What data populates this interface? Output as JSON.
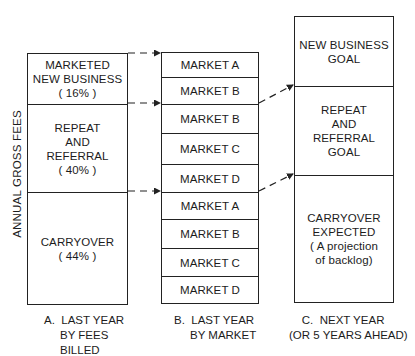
{
  "y_axis_label": "ANNUAL GROSS FEES",
  "columns": [
    {
      "id": "A",
      "caption": "A.  LAST YEAR\n     BY FEES\n     BILLED",
      "segments": [
        {
          "label": "MARKETED\nNEW BUSINESS\n( 16% )",
          "percent": 16
        },
        {
          "label": "REPEAT\nAND\nREFERRAL\n( 40% )",
          "percent": 40
        },
        {
          "label": "CARRYOVER\n( 44% )",
          "percent": 44
        }
      ]
    },
    {
      "id": "B",
      "caption": "B.  LAST YEAR\n     BY MARKET",
      "segments": [
        {
          "label": "MARKET A"
        },
        {
          "label": "MARKET B"
        },
        {
          "label": "MARKET B"
        },
        {
          "label": "MARKET C"
        },
        {
          "label": "MARKET D"
        },
        {
          "label": "MARKET A"
        },
        {
          "label": "MARKET B"
        },
        {
          "label": "MARKET C"
        },
        {
          "label": "MARKET D"
        }
      ]
    },
    {
      "id": "C",
      "caption": "    C.  NEXT YEAR\n(OR 5 YEARS AHEAD)",
      "segments": [
        {
          "label": "NEW BUSINESS\nGOAL"
        },
        {
          "label": "REPEAT\nAND\nREFERRAL\nGOAL"
        },
        {
          "label": "CARRYOVER\nEXPECTED\n( A projection\nof backlog)"
        }
      ]
    }
  ],
  "connectors": [
    {
      "from": "A.top",
      "to": "B.top",
      "style": "dashed-arrow"
    },
    {
      "from": "A.new_business_bottom",
      "to": "B.row2_bottom",
      "style": "dashed-arrow"
    },
    {
      "from": "A.repeat_bottom",
      "to": "B.row5_bottom",
      "style": "dashed-arrow"
    },
    {
      "from": "B.row2_bottom",
      "to": "C.new_business_bottom",
      "style": "dashed-arrow"
    },
    {
      "from": "B.row5_bottom",
      "to": "C.repeat_bottom",
      "style": "dashed-arrow"
    }
  ]
}
